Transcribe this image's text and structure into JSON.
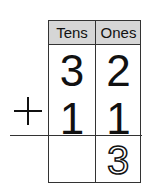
{
  "table": {
    "headers": [
      "Tens",
      "Ones"
    ],
    "rows": {
      "addend1": {
        "tens": "3",
        "ones": "2"
      },
      "addend2": {
        "tens": "1",
        "ones": "1"
      },
      "sum": {
        "tens": "",
        "ones": "3"
      }
    },
    "operator": "+"
  }
}
